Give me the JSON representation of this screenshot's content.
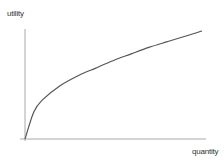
{
  "chart_data": {
    "type": "line",
    "title": "",
    "xlabel": "quantity",
    "ylabel": "utility",
    "grid": false,
    "legend": null,
    "ticks": {
      "x": [],
      "y": []
    },
    "xlim": [
      0,
      1
    ],
    "ylim": [
      0,
      1
    ],
    "series": [
      {
        "name": "utility",
        "shape": "concave, increasing (diminishing marginal utility)",
        "x": [
          0,
          0.05,
          0.1,
          0.2,
          0.3,
          0.4,
          0.5,
          0.6,
          0.7,
          0.8,
          0.9,
          1.0
        ],
        "y": [
          0,
          0.25,
          0.36,
          0.49,
          0.58,
          0.65,
          0.72,
          0.78,
          0.84,
          0.89,
          0.94,
          0.99
        ]
      }
    ]
  },
  "colors": {
    "axis": "#aaaaaa",
    "curve": "#555555",
    "text": "#333333",
    "background": "#ffffff"
  }
}
